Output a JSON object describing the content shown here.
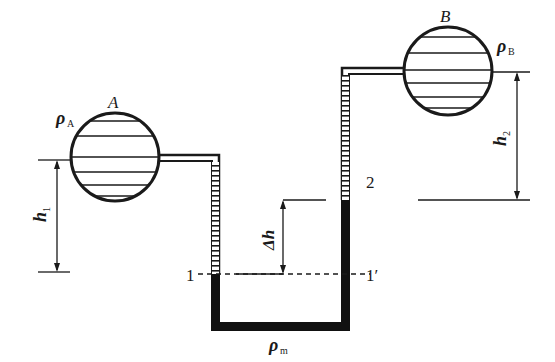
{
  "diagram": {
    "type": "U-tube differential manometer connecting two vessels",
    "vessels": [
      {
        "id": "A",
        "label": "A",
        "density_label": "ρ",
        "density_sub": "A"
      },
      {
        "id": "B",
        "label": "B",
        "density_label": "ρ",
        "density_sub": "B"
      }
    ],
    "manometer_fluid": {
      "density_label": "ρ",
      "density_sub": "m"
    },
    "dimensions": [
      {
        "id": "h1",
        "label": "h",
        "sub": "1"
      },
      {
        "id": "h2",
        "label": "h",
        "sub": "2"
      },
      {
        "id": "dh",
        "label": "Δh"
      }
    ],
    "levels": {
      "left": "1",
      "right": "1′",
      "point2": "2"
    },
    "colors": {
      "line": "#1a1a1a",
      "fluid": "#111111",
      "background": "#ffffff"
    }
  }
}
